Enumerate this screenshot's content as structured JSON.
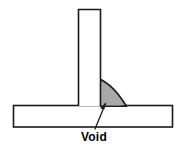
{
  "figure": {
    "annotation_label": "Void",
    "colors": {
      "background": "#ffffff",
      "outline": "#1a1a1a",
      "weld_fill": "#a8a8a8",
      "weld_outline": "#1a1a1a",
      "leader_line": "#1a1a1a",
      "text": "#000000"
    }
  },
  "parts": {
    "vertical_plate": {
      "name": "vertical-plate",
      "left": 78,
      "right": 101,
      "top": 9,
      "bottom": 106
    },
    "horizontal_plate": {
      "name": "horizontal-plate",
      "left": 13,
      "right": 173,
      "top": 105,
      "bottom": 127
    },
    "weld_fillet": {
      "name": "weld-fillet",
      "fill": "#a8a8a8",
      "path": "M101,80 L101,106 L126,106 C124,96 116,85 101,80 Z"
    },
    "void": {
      "name": "void-cavity",
      "tip_x": 104,
      "tip_y": 104
    }
  },
  "annotation": {
    "leader_line": {
      "name": "void-leader-line",
      "x1": 95,
      "y1": 129,
      "x2": 105,
      "y2": 104
    },
    "arrowhead": {
      "name": "void-arrowhead",
      "points": "105,104 100,109 104,110"
    },
    "text": "Void"
  }
}
